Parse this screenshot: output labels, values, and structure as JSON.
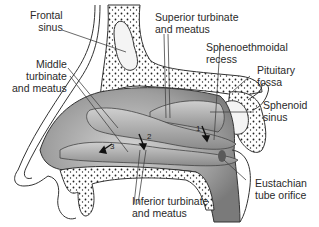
{
  "diagram": {
    "type": "anatomical-sagittal-section",
    "labels": {
      "frontal_sinus": "Frontal\nsinus",
      "superior_turbinate": "Superior turbinate\nand meatus",
      "sphenoethmoidal_recess": "Sphenoethmoidal\nrecess",
      "pituitary_fossa": "Pituitary\nfossa",
      "sphenoid_sinus": "Sphenoid\nsinus",
      "middle_turbinate": "Middle\nturbinate\nand meatus",
      "inferior_turbinate": "Inferior turbinate\nand meatus",
      "eustachian_tube": "Eustachian\ntube orifice"
    },
    "arrow_numbers": [
      "1",
      "2",
      "3"
    ],
    "colors": {
      "tissue_gray": "#9a9a9a",
      "tissue_light": "#c8c8c8",
      "bone_outline": "#333333",
      "background": "#ffffff"
    }
  }
}
